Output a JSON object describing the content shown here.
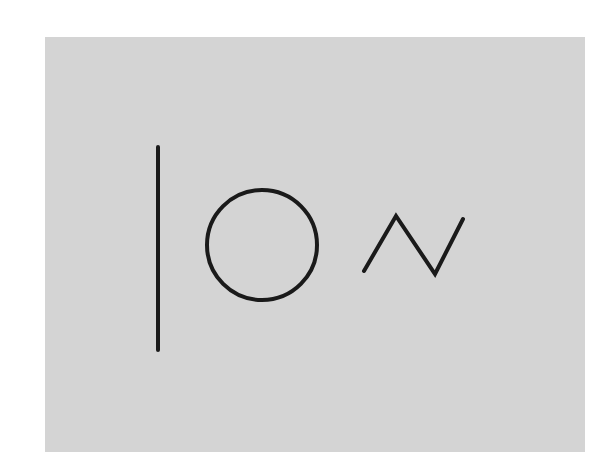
{
  "canvas": {
    "width": 614,
    "height": 471,
    "background": "#ffffff"
  },
  "panel": {
    "x": 45,
    "y": 37,
    "width": 540,
    "height": 415,
    "color": "#d4d4d4"
  },
  "stroke": {
    "color": "#1a1a1a",
    "width": 4
  },
  "shapes": [
    {
      "type": "line",
      "name": "vertical-line",
      "x1": 158,
      "y1": 147,
      "x2": 158,
      "y2": 350
    },
    {
      "type": "circle",
      "name": "circle",
      "cx": 262,
      "cy": 245,
      "r": 55
    },
    {
      "type": "polyline",
      "name": "zigzag",
      "points": [
        [
          364,
          271
        ],
        [
          396,
          216
        ],
        [
          435,
          274
        ],
        [
          463,
          219
        ]
      ]
    }
  ]
}
